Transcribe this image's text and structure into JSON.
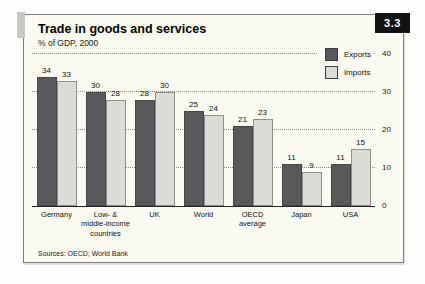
{
  "header": {
    "title": "Trade in goods and services",
    "subtitle": "% of GDP, 2000",
    "figure_number": "3.3"
  },
  "legend": {
    "items": [
      {
        "label": "Exports",
        "color": "#59595b"
      },
      {
        "label": "Imports",
        "color": "#dcdcd6"
      }
    ]
  },
  "chart_data": {
    "type": "bar",
    "title": "Trade in goods and services",
    "subtitle": "% of GDP, 2000",
    "categories": [
      "Germany",
      "Low- &\nmiddle-income\ncountries",
      "UK",
      "World",
      "OECD\naverage",
      "Japan",
      "USA"
    ],
    "series": [
      {
        "name": "Exports",
        "values": [
          34,
          30,
          28,
          25,
          21,
          11,
          11
        ]
      },
      {
        "name": "Imports",
        "values": [
          33,
          28,
          30,
          24,
          23,
          9,
          15
        ]
      }
    ],
    "xlabel": "",
    "ylabel": "",
    "ylim": [
      0,
      40
    ],
    "yticks": [
      0,
      10,
      20,
      30,
      40
    ],
    "grid": "dotted horizontal",
    "legend_position": "top-right",
    "value_labels": true,
    "colors": {
      "dark_bar": "#59595b",
      "light_bar": "#dcdcd6",
      "panel_background": "#fbfaf0",
      "badge_background": "#121212"
    }
  },
  "footer": {
    "source": "Sources: OECD; World Bank"
  }
}
